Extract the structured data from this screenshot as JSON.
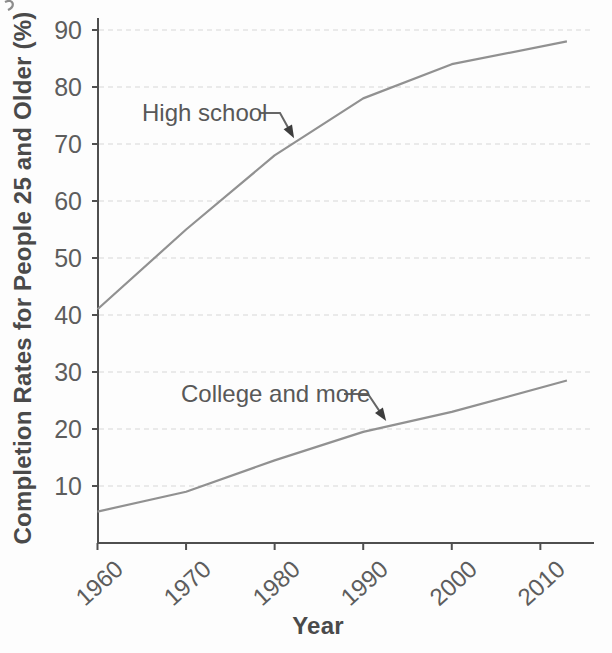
{
  "figure": {
    "background": "#fdfdfd"
  },
  "chart_data": {
    "type": "line",
    "title": "",
    "xlabel": "Year",
    "ylabel": "Completion Rates for People 25 and Older (%)",
    "x": [
      1960,
      1970,
      1980,
      1990,
      2000,
      2013
    ],
    "series": [
      {
        "name": "High school",
        "values": [
          41,
          55,
          68,
          78,
          84,
          88
        ]
      },
      {
        "name": "College and more",
        "values": [
          5.5,
          9,
          14.5,
          19.5,
          23,
          28.5
        ]
      }
    ],
    "x_ticks": [
      1960,
      1970,
      1980,
      1990,
      2000,
      2010
    ],
    "y_ticks": [
      10,
      20,
      30,
      40,
      50,
      60,
      70,
      80,
      90
    ],
    "xlim": [
      1960,
      2016
    ],
    "ylim": [
      0,
      92
    ],
    "grid": "horizontal-dashed",
    "legend": "none",
    "annotations": [
      {
        "text": "High school",
        "target_year": 1982.2,
        "target_value": 71
      },
      {
        "text": "College and more",
        "target_year": 1992.6,
        "target_value": 21.4
      }
    ],
    "colors": {
      "line": "#919191",
      "axis": "#4f4f4f",
      "grid": "#d8d8d8",
      "tick_text": "#5d5d5d",
      "title_text": "#4a4a4a",
      "arrow": "#666666",
      "arrow_head": "#3d3d3d"
    }
  }
}
